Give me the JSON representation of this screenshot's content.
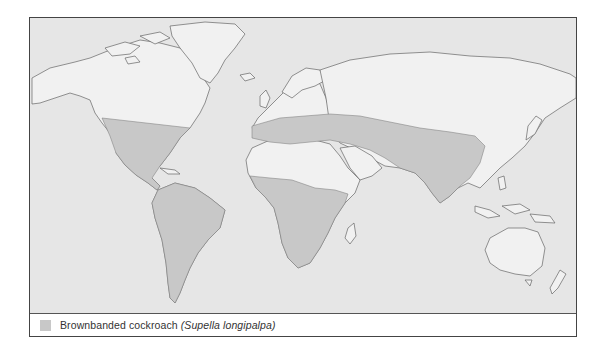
{
  "map": {
    "title": "World distribution map",
    "colors": {
      "ocean": "#e6e6e6",
      "land": "#f1f1f1",
      "range": "#c8c8c8",
      "coast": "#666666"
    }
  },
  "legend": {
    "items": [
      {
        "swatch_color": "#c8c8c8",
        "common_name": "Brownbanded cockroach",
        "scientific_name": "(Supella longipalpa)"
      }
    ]
  }
}
